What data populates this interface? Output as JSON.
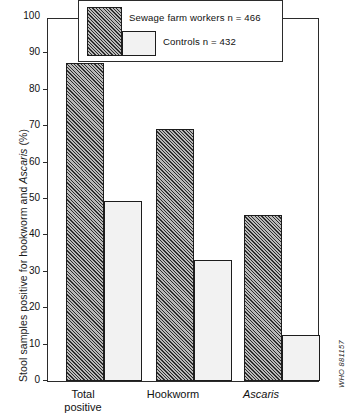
{
  "chart_data": {
    "type": "bar",
    "title": "",
    "subtitle": "",
    "xlabel": "",
    "ylabel": "Stool samples positive for hookworm and Ascaris (%)",
    "ylabel_parts": {
      "before_italic": "Stool samples positive for hookworm and ",
      "italic": "Ascaris",
      "after_italic": " (%)"
    },
    "categories": [
      "Total positive",
      "Hookworm",
      "Ascaris"
    ],
    "category_labels": [
      {
        "line1": "Total",
        "line2": "positive",
        "italic": false
      },
      {
        "line1": "Hookworm",
        "line2": "",
        "italic": false
      },
      {
        "line1": "Ascaris",
        "line2": "",
        "italic": true
      }
    ],
    "series": [
      {
        "name": "Sewage farm workers n = 466",
        "values": [
          87.5,
          69.2,
          45.6
        ],
        "pattern": "diagonal-hatch",
        "color": "#b9b9b9"
      },
      {
        "name": "Controls n = 432",
        "values": [
          49.5,
          33.2,
          12.6
        ],
        "pattern": "dotted-stipple",
        "color": "#f2f2f2"
      }
    ],
    "ylim": [
      0,
      100
    ],
    "yticks": [
      0,
      10,
      20,
      30,
      40,
      50,
      60,
      70,
      80,
      90,
      100
    ],
    "ytick_labels": [
      "0",
      "10",
      "20",
      "30",
      "40",
      "50",
      "60",
      "70",
      "80",
      "90",
      "100"
    ],
    "grid": false,
    "legend_position": "top-center"
  },
  "legend": {
    "entry_1": "Sewage farm workers n = 466",
    "entry_2": "Controls n = 432"
  },
  "footer": {
    "who_code": "WHO 881157"
  }
}
